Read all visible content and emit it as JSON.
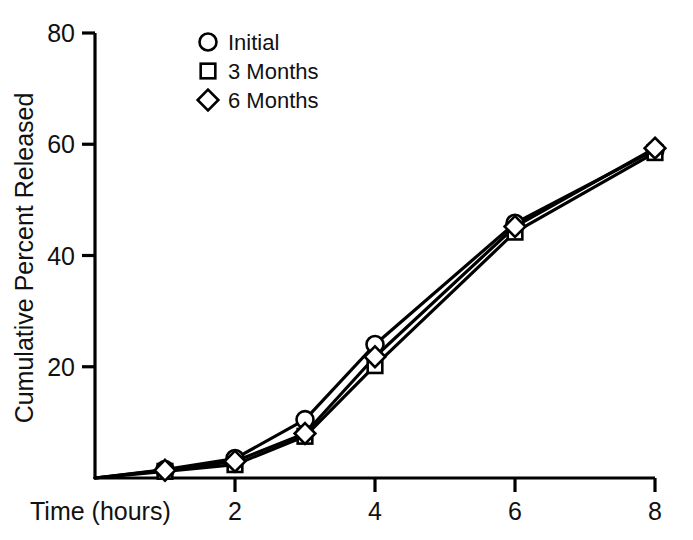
{
  "chart_data": {
    "type": "line",
    "title": "",
    "subtitle": "",
    "xlabel": "Time (hours)",
    "ylabel": "Cumulative Percent Released",
    "xlim": [
      0,
      8
    ],
    "ylim": [
      0,
      80
    ],
    "xticks": [
      2,
      4,
      6,
      8
    ],
    "yticks": [
      20,
      40,
      60,
      80
    ],
    "xtick_labels": [
      "2",
      "4",
      "6",
      "8"
    ],
    "ytick_labels": [
      "20",
      "40",
      "60",
      "80"
    ],
    "grid": false,
    "legend_position": "top-center",
    "x": [
      0,
      1,
      2,
      3,
      4,
      6,
      8
    ],
    "series": [
      {
        "name": "Initial",
        "marker": "circle",
        "values": [
          0,
          1.5,
          3.5,
          10.5,
          24.0,
          45.8,
          59.0
        ]
      },
      {
        "name": "3 Months",
        "marker": "square",
        "values": [
          0,
          1.2,
          2.4,
          7.5,
          20.2,
          44.2,
          58.5
        ]
      },
      {
        "name": "6 Months",
        "marker": "diamond",
        "values": [
          0,
          1.4,
          3.0,
          8.0,
          21.8,
          45.2,
          59.3
        ]
      }
    ]
  },
  "legend": {
    "items": [
      {
        "label": "Initial",
        "marker": "circle"
      },
      {
        "label": "3 Months",
        "marker": "square"
      },
      {
        "label": "6 Months",
        "marker": "diamond"
      }
    ]
  },
  "axes": {
    "x_title": "Time (hours)",
    "y_title": "Cumulative Percent Released"
  },
  "colors": {
    "line": "#000000",
    "marker_fill": "#ffffff",
    "axis": "#000000",
    "text": "#111111",
    "background": "#ffffff"
  }
}
